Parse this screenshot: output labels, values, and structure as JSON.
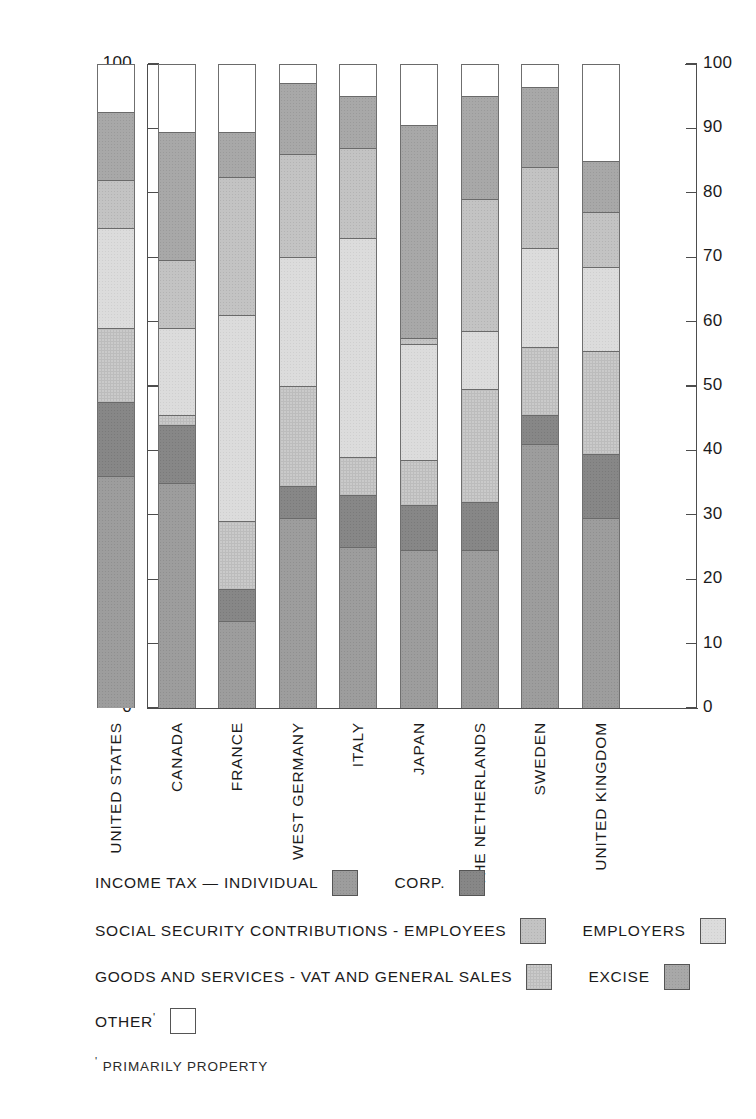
{
  "chart_data": {
    "type": "bar",
    "subtype": "stacked-bar-100-percent",
    "title": "",
    "xlabel": "",
    "ylabel": "",
    "ylim": [
      0,
      100
    ],
    "yticks": [
      0,
      10,
      20,
      30,
      40,
      50,
      60,
      70,
      80,
      90,
      100
    ],
    "ytick_labels": [
      "0",
      "10",
      "20",
      "30",
      "40",
      "50",
      "60",
      "70",
      "80",
      "90",
      "100"
    ],
    "dual_y_axis": true,
    "grid": false,
    "legend_position": "below",
    "categories": [
      "UNITED STATES",
      "CANADA",
      "FRANCE",
      "WEST GERMANY",
      "ITALY",
      "JAPAN",
      "THE NETHERLANDS",
      "SWEDEN",
      "UNITED KINGDOM"
    ],
    "series": [
      {
        "name": "INCOME TAX – INDIVIDUAL",
        "key": "individual",
        "color": "#9d9d9d",
        "values": [
          36.0,
          35.0,
          13.5,
          29.5,
          25.0,
          24.5,
          24.5,
          41.0,
          29.5
        ]
      },
      {
        "name": "CORP.",
        "key": "corp",
        "color": "#878787",
        "values": [
          11.5,
          9.0,
          5.0,
          5.0,
          8.0,
          7.0,
          7.5,
          4.5,
          10.0
        ]
      },
      {
        "name": "GOODS AND SERVICES - VAT AND GENERAL SALES",
        "key": "vat",
        "color": "#cacaca",
        "values": [
          11.5,
          1.5,
          10.5,
          15.5,
          6.0,
          7.0,
          17.5,
          10.5,
          16.0
        ]
      },
      {
        "name": "SOCIAL SECURITY CONTRIBUTIONS - EMPLOYERS",
        "key": "ss_employers",
        "color": "#dcdcdc",
        "values": [
          15.5,
          13.5,
          32.0,
          20.0,
          34.0,
          18.0,
          9.0,
          15.5,
          13.0
        ]
      },
      {
        "name": "SOCIAL SECURITY CONTRIBUTIONS - EMPLOYEES",
        "key": "ss_employees",
        "color": "#c3c3c3",
        "values": [
          7.5,
          10.5,
          21.5,
          16.0,
          14.0,
          1.0,
          20.5,
          12.5,
          8.5
        ]
      },
      {
        "name": "EXCISE",
        "key": "excise",
        "color": "#a8a8a8",
        "values": [
          10.5,
          20.0,
          7.0,
          11.0,
          8.0,
          33.0,
          16.0,
          12.5,
          8.0
        ]
      },
      {
        "name": "OTHER",
        "key": "other",
        "color": "#ffffff",
        "values": [
          7.5,
          10.5,
          10.5,
          3.0,
          4.5,
          9.5,
          5.0,
          3.5,
          15.0
        ]
      }
    ],
    "stack_tops": {
      "UNITED STATES": [
        36.0,
        47.5,
        59.0,
        74.5,
        82.0,
        92.5,
        100
      ],
      "CANADA": [
        35.0,
        44.0,
        45.5,
        59.0,
        69.5,
        89.5,
        100
      ],
      "FRANCE": [
        13.5,
        18.5,
        29.0,
        61.0,
        82.5,
        89.5,
        100
      ],
      "WEST GERMANY": [
        29.5,
        34.5,
        50.0,
        70.0,
        86.0,
        97.0,
        100
      ],
      "ITALY": [
        25.0,
        33.0,
        39.0,
        73.0,
        87.0,
        95.0,
        100
      ],
      "JAPAN": [
        24.5,
        31.5,
        38.5,
        56.5,
        57.5,
        90.5,
        100
      ],
      "THE NETHERLANDS": [
        24.5,
        32.0,
        49.5,
        58.5,
        79.0,
        95.0,
        100
      ],
      "SWEDEN": [
        41.0,
        45.5,
        56.0,
        71.5,
        84.0,
        96.5,
        100
      ],
      "UNITED KINGDOM": [
        29.5,
        39.5,
        55.5,
        68.5,
        77.0,
        85.0,
        100
      ]
    }
  },
  "legend": {
    "rows": [
      {
        "label_a": "INCOME TAX — INDIVIDUAL",
        "swatch_a": "individual",
        "label_b": "CORP.",
        "swatch_b": "corp"
      },
      {
        "label_a": "SOCIAL SECURITY CONTRIBUTIONS - EMPLOYEES",
        "swatch_a": "ss_employees",
        "label_b": "EMPLOYERS",
        "swatch_b": "ss_employers"
      },
      {
        "label_a": "GOODS AND SERVICES - VAT AND GENERAL SALES",
        "swatch_a": "vat",
        "label_b": "EXCISE",
        "swatch_b": "excise"
      }
    ],
    "other_label": "OTHER",
    "other_mark": "'",
    "footnote": "PRIMARILY  PROPERTY",
    "footnote_mark": "'"
  }
}
